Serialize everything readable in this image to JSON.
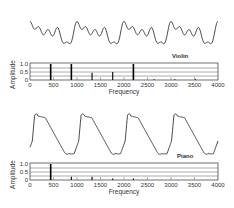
{
  "chart_data": [
    {
      "type": "bar",
      "title": "Violin",
      "waveform_label": "Violin",
      "xlabel": "Frequency",
      "ylabel": "Amplitude",
      "xlim": [
        0,
        4000
      ],
      "ylim": [
        0,
        1.0
      ],
      "xticks": [
        "0",
        "500",
        "1000",
        "1500",
        "2000",
        "2500",
        "3000",
        "3500",
        "4000"
      ],
      "yticks": [
        "0",
        "0.5",
        "1.0"
      ],
      "grid": true,
      "x": [
        440,
        880,
        1320,
        1760,
        2200,
        2640,
        3080,
        3520
      ],
      "values": [
        1.0,
        1.0,
        0.45,
        0.5,
        1.0,
        0.05,
        0.05,
        0.05
      ]
    },
    {
      "type": "bar",
      "title": "Piano",
      "waveform_label": "Piano",
      "xlabel": "Frequency",
      "ylabel": "Amplitude",
      "xlim": [
        0,
        4000
      ],
      "ylim": [
        0,
        1.0
      ],
      "xticks": [
        "0",
        "500",
        "1000",
        "1500",
        "2000",
        "2500",
        "3000",
        "3500",
        "4000"
      ],
      "yticks": [
        "0",
        "0.5",
        "1.0"
      ],
      "grid": true,
      "x": [
        440,
        880,
        1320,
        1760,
        2200
      ],
      "values": [
        1.0,
        0.2,
        0.2,
        0.1,
        0.1
      ]
    }
  ],
  "labels": {
    "violin": "Violin",
    "piano": "Piano",
    "frequency": "Frequency",
    "amplitude": "Amplitude"
  }
}
